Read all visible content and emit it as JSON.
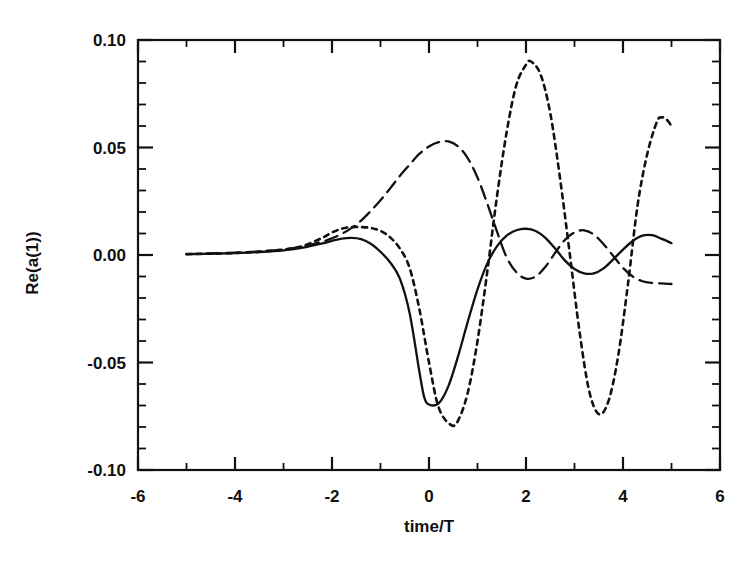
{
  "chart_data": {
    "type": "line",
    "title": "",
    "subtitle": "",
    "xlabel": "time/T",
    "ylabel": "Re(a(1))",
    "xlim": [
      -6,
      6
    ],
    "ylim": [
      -0.1,
      0.1
    ],
    "grid": false,
    "legend": "none",
    "x_ticks_major": [
      -6,
      -4,
      -2,
      0,
      2,
      4,
      6
    ],
    "x_tick_labels": [
      "-6",
      "-4",
      "-2",
      "0",
      "2",
      "4",
      "6"
    ],
    "x_ticks_minor": [
      -5,
      -3,
      -1,
      1,
      3,
      5
    ],
    "y_ticks_major": [
      -0.1,
      -0.05,
      0.0,
      0.05,
      0.1
    ],
    "y_tick_labels": [
      "-0.10",
      "-0.05",
      "0.00",
      "0.05",
      "0.10"
    ],
    "y_ticks_minor": [
      -0.09,
      -0.08,
      -0.07,
      -0.06,
      -0.04,
      -0.03,
      -0.02,
      -0.01,
      0.01,
      0.02,
      0.03,
      0.04,
      0.06,
      0.07,
      0.08,
      0.09
    ],
    "series": [
      {
        "name": "solid",
        "style": "solid",
        "color": "#111111",
        "x": [
          -5.0,
          -4.5,
          -4.0,
          -3.5,
          -3.0,
          -2.6,
          -2.2,
          -2.0,
          -1.8,
          -1.6,
          -1.4,
          -1.2,
          -1.0,
          -0.8,
          -0.6,
          -0.4,
          -0.2,
          -0.1,
          0.0,
          0.2,
          0.4,
          0.6,
          0.8,
          1.0,
          1.2,
          1.4,
          1.6,
          1.8,
          2.0,
          2.2,
          2.4,
          2.6,
          2.8,
          3.0,
          3.2,
          3.4,
          3.6,
          3.8,
          4.0,
          4.2,
          4.4,
          4.6,
          4.8,
          5.0
        ],
        "y": [
          0.0004,
          0.0006,
          0.0009,
          0.0014,
          0.0022,
          0.0034,
          0.0054,
          0.0066,
          0.0076,
          0.008,
          0.0074,
          0.0052,
          0.0015,
          -0.0035,
          -0.011,
          -0.027,
          -0.054,
          -0.066,
          -0.0695,
          -0.069,
          -0.061,
          -0.047,
          -0.031,
          -0.016,
          -0.004,
          0.004,
          0.009,
          0.0115,
          0.0122,
          0.0112,
          0.008,
          0.003,
          -0.0025,
          -0.0065,
          -0.0085,
          -0.0085,
          -0.0062,
          -0.002,
          0.0025,
          0.0065,
          0.009,
          0.0092,
          0.0075,
          0.0055
        ]
      },
      {
        "name": "dotted",
        "style": "dotted",
        "color": "#111111",
        "x": [
          -5.0,
          -4.5,
          -4.0,
          -3.5,
          -3.0,
          -2.6,
          -2.2,
          -2.0,
          -1.8,
          -1.6,
          -1.4,
          -1.2,
          -1.0,
          -0.8,
          -0.6,
          -0.4,
          -0.2,
          0.0,
          0.2,
          0.45,
          0.6,
          0.8,
          1.0,
          1.2,
          1.4,
          1.6,
          1.8,
          2.0,
          2.1,
          2.3,
          2.5,
          2.7,
          2.9,
          3.1,
          3.3,
          3.5,
          3.7,
          3.9,
          4.1,
          4.3,
          4.5,
          4.7,
          4.8,
          4.9,
          5.0
        ],
        "y": [
          0.0004,
          0.0006,
          0.0009,
          0.0015,
          0.0025,
          0.0042,
          0.008,
          0.0105,
          0.0122,
          0.013,
          0.013,
          0.0126,
          0.0112,
          0.0082,
          0.003,
          -0.006,
          -0.025,
          -0.05,
          -0.071,
          -0.079,
          -0.077,
          -0.064,
          -0.04,
          -0.008,
          0.027,
          0.057,
          0.079,
          0.0885,
          0.09,
          0.084,
          0.066,
          0.036,
          0.001,
          -0.035,
          -0.063,
          -0.074,
          -0.068,
          -0.047,
          -0.014,
          0.023,
          0.047,
          0.062,
          0.064,
          0.063,
          0.06
        ]
      },
      {
        "name": "long-dashed",
        "style": "dashed",
        "color": "#111111",
        "x": [
          -5.0,
          -4.5,
          -4.0,
          -3.5,
          -3.0,
          -2.6,
          -2.2,
          -2.0,
          -1.8,
          -1.6,
          -1.4,
          -1.2,
          -1.0,
          -0.8,
          -0.6,
          -0.4,
          -0.2,
          0.0,
          0.2,
          0.4,
          0.6,
          0.8,
          1.0,
          1.2,
          1.4,
          1.6,
          1.8,
          2.0,
          2.2,
          2.4,
          2.6,
          2.8,
          3.0,
          3.2,
          3.4,
          3.6,
          3.8,
          4.0,
          4.2,
          4.4,
          4.6,
          4.8,
          5.0
        ],
        "y": [
          0.0004,
          0.0007,
          0.0011,
          0.0017,
          0.0026,
          0.004,
          0.0062,
          0.0078,
          0.0098,
          0.0125,
          0.016,
          0.0205,
          0.0255,
          0.031,
          0.0368,
          0.042,
          0.047,
          0.0505,
          0.0525,
          0.0528,
          0.0505,
          0.045,
          0.036,
          0.024,
          0.011,
          -0.001,
          -0.008,
          -0.011,
          -0.01,
          -0.0055,
          0.001,
          0.007,
          0.0105,
          0.0115,
          0.0095,
          0.005,
          -0.0005,
          -0.006,
          -0.01,
          -0.0122,
          -0.013,
          -0.0132,
          -0.0135
        ]
      }
    ],
    "annotations": []
  },
  "axes": {
    "y_label": "Re(a(1))",
    "x_label": "time/T"
  }
}
